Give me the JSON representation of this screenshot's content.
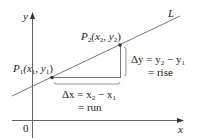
{
  "diagram": {
    "axes": {
      "x_label": "x",
      "y_label": "y",
      "origin_label": "0"
    },
    "line_label": "L",
    "points": [
      {
        "name": "P1",
        "label_main": "P",
        "label_sub": "1",
        "coords_open": "(x",
        "coords_sub1": "1",
        "coords_mid": ", y",
        "coords_sub2": "1",
        "coords_close": ")"
      },
      {
        "name": "P2",
        "label_main": "P",
        "label_sub": "2",
        "coords_open": "(x",
        "coords_sub1": "2",
        "coords_mid": ", y",
        "coords_sub2": "2",
        "coords_close": ")"
      }
    ],
    "delta_x": {
      "line1_prefix": "Δx = x",
      "sub_a": "2",
      "minus": " − x",
      "sub_b": "1",
      "line2": "= run"
    },
    "delta_y": {
      "line1_prefix": "Δy = y",
      "sub_a": "2",
      "minus": " − y",
      "sub_b": "1",
      "line2": "= rise"
    },
    "colors": {
      "stroke": "#6a6a6a",
      "axis": "#555555",
      "text": "#222222",
      "point": "#333333"
    }
  }
}
